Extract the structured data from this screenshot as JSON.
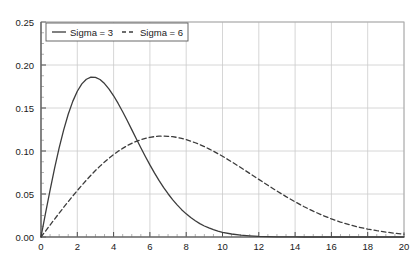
{
  "chart_data": {
    "type": "line",
    "title": "",
    "subtitle": "",
    "xlabel": "",
    "ylabel": "",
    "xlim": [
      0,
      20
    ],
    "ylim": [
      0,
      0.25
    ],
    "grid": true,
    "legend_position": "top-left",
    "xticks": [
      0,
      2,
      4,
      6,
      8,
      10,
      12,
      14,
      16,
      18,
      20
    ],
    "xticklabels": [
      "0",
      "2",
      "4",
      "6",
      "8",
      "10",
      "12",
      "14",
      "16",
      "18",
      "20"
    ],
    "yticks": [
      0.0,
      0.05,
      0.1,
      0.15,
      0.2,
      0.25
    ],
    "yticklabels": [
      "0.00",
      "0.05",
      "0.10",
      "0.15",
      "0.20",
      "0.25"
    ],
    "x": [
      0,
      0.25,
      0.5,
      0.75,
      1,
      1.25,
      1.5,
      1.75,
      2,
      2.25,
      2.5,
      2.75,
      3,
      3.25,
      3.5,
      3.75,
      4,
      4.25,
      4.5,
      4.75,
      5,
      5.25,
      5.5,
      5.75,
      6,
      6.25,
      6.5,
      6.75,
      7,
      7.25,
      7.5,
      7.75,
      8,
      8.25,
      8.5,
      8.75,
      9,
      9.25,
      9.5,
      9.75,
      10,
      10.5,
      11,
      11.5,
      12,
      12.5,
      13,
      13.5,
      14,
      14.5,
      15,
      15.5,
      16,
      16.5,
      17,
      17.5,
      18,
      18.5,
      19,
      19.5,
      20
    ],
    "series": [
      {
        "name": "Sigma = 3",
        "linestyle": "solid",
        "color": "#3c3c3c",
        "peak_x": 3,
        "peak_y": 0.2022,
        "values": [
          0,
          0.0277,
          0.0546,
          0.0801,
          0.1036,
          0.1246,
          0.1427,
          0.1577,
          0.1695,
          0.178,
          0.1834,
          0.1859,
          0.1857,
          0.1831,
          0.1784,
          0.172,
          0.1642,
          0.1553,
          0.1456,
          0.1354,
          0.1249,
          0.1143,
          0.1038,
          0.0936,
          0.0838,
          0.0745,
          0.0658,
          0.0577,
          0.0503,
          0.0435,
          0.0373,
          0.0318,
          0.0269,
          0.0226,
          0.0189,
          0.0156,
          0.0128,
          0.0105,
          0.0085,
          0.0069,
          0.0055,
          0.0035,
          0.0021,
          0.0013,
          0.0007,
          0.0004,
          0.0002,
          0.0001,
          0.0001,
          0,
          0,
          0,
          0,
          0,
          0,
          0,
          0,
          0,
          0,
          0,
          0
        ]
      },
      {
        "name": "Sigma = 6",
        "linestyle": "dashed",
        "color": "#3c3c3c",
        "peak_x": 6,
        "peak_y": 0.1011,
        "values": [
          0,
          0.0069,
          0.0139,
          0.0208,
          0.0277,
          0.0345,
          0.0411,
          0.0477,
          0.054,
          0.0602,
          0.0661,
          0.0718,
          0.0773,
          0.0824,
          0.0872,
          0.0917,
          0.0959,
          0.0997,
          0.1031,
          0.1062,
          0.1089,
          0.1112,
          0.1131,
          0.1147,
          0.1159,
          0.1167,
          0.1172,
          0.1173,
          0.1171,
          0.1166,
          0.1158,
          0.1146,
          0.1132,
          0.1115,
          0.1096,
          0.1074,
          0.1051,
          0.1025,
          0.0998,
          0.0969,
          0.0939,
          0.0875,
          0.0808,
          0.0739,
          0.067,
          0.0601,
          0.0534,
          0.047,
          0.0409,
          0.0352,
          0.03,
          0.0253,
          0.0211,
          0.0174,
          0.0142,
          0.0115,
          0.0092,
          0.0073,
          0.0057,
          0.0044,
          0.0034
        ]
      }
    ]
  },
  "legend": {
    "entries": [
      {
        "label": "Sigma = 3",
        "style": "solid"
      },
      {
        "label": "Sigma = 6",
        "style": "dashed"
      }
    ]
  },
  "colors": {
    "curve": "#3c3c3c",
    "grid": "#cccccc",
    "frame": "#aaaaaa",
    "text": "#1a1a1a",
    "background": "#ffffff"
  }
}
